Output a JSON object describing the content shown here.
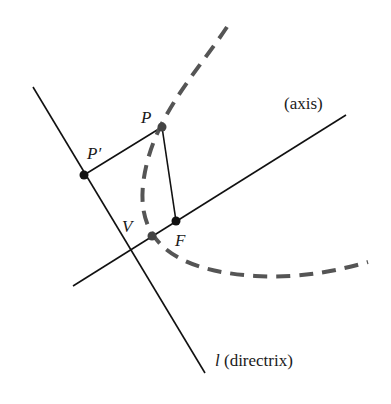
{
  "diagram": {
    "kind": "parabola-focus-directrix",
    "colors": {
      "line": "#111111",
      "curve": "#555555",
      "point": "#111111",
      "vertex_point": "#444444",
      "text": "#1a1a1a"
    },
    "lines": {
      "directrix": {
        "x1": 33,
        "y1": 87,
        "x2": 205,
        "y2": 373
      },
      "axis": {
        "x1": 73,
        "y1": 286,
        "x2": 346,
        "y2": 115
      },
      "p_to_pprime": {
        "x1": 162,
        "y1": 127,
        "x2": 84,
        "y2": 175
      },
      "p_to_f": {
        "x1": 162,
        "y1": 127,
        "x2": 176,
        "y2": 221
      }
    },
    "curve": {
      "path": "M 227 27 C 195 75, 150 120, 143 185 C 138 235, 165 270, 255 276 C 300 279, 340 270, 368 262",
      "dash": "14 9",
      "width": 4
    },
    "points": [
      {
        "id": "P",
        "x": 162,
        "y": 127,
        "r": 4.5
      },
      {
        "id": "P-prime",
        "x": 84,
        "y": 175,
        "r": 4.5
      },
      {
        "id": "F",
        "x": 176,
        "y": 221,
        "r": 4.5
      },
      {
        "id": "V",
        "x": 152,
        "y": 236,
        "r": 4.5
      }
    ],
    "labels": {
      "P": "P",
      "P_prime": "P′",
      "V": "V",
      "F": "F",
      "axis": "(axis)",
      "directrix_symbol": "l",
      "directrix_text": " (directrix)"
    }
  }
}
